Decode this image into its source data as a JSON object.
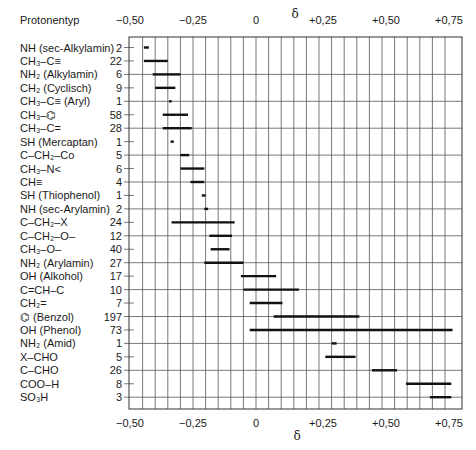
{
  "chart_data": {
    "type": "range-bar",
    "title": "",
    "column_header_left": "Protonentyp",
    "xlabel": "δ",
    "ylabel": "",
    "xlim": [
      -0.5,
      0.8
    ],
    "x_ticks": [
      -0.5,
      -0.25,
      0,
      0.25,
      0.5,
      0.75
    ],
    "x_tick_labels": [
      "−0,50",
      "−0,25",
      "0",
      "+0,25",
      "+0,50",
      "+0,75"
    ],
    "grid": {
      "vertical_step": 0.05,
      "horizontal_full_lines_every_other_row": true
    },
    "axes_top_and_bottom": true,
    "rows": [
      {
        "label": "NH (sec-Alkylamin)",
        "count": 2,
        "min": -0.445,
        "max": -0.425
      },
      {
        "label": "CH₃–C≡",
        "count": 22,
        "min": -0.445,
        "max": -0.35
      },
      {
        "label": "NH₂ (Alkylamin)",
        "count": 6,
        "min": -0.41,
        "max": -0.3
      },
      {
        "label": "CH₂ (Cyclisch)",
        "count": 9,
        "min": -0.4,
        "max": -0.32
      },
      {
        "label": "CH₃–C≡ (Aryl)",
        "count": 1,
        "min": -0.345,
        "max": -0.335
      },
      {
        "label": "CH₃–⌬",
        "count": 58,
        "min": -0.37,
        "max": -0.27
      },
      {
        "label": "CH₃–C=",
        "count": 28,
        "min": -0.37,
        "max": -0.255
      },
      {
        "label": "SH (Mercaptan)",
        "count": 1,
        "min": -0.335,
        "max": -0.33
      },
      {
        "label": "C–CH₂–Co",
        "count": 5,
        "min": -0.3,
        "max": -0.265
      },
      {
        "label": "CH₃–N<",
        "count": 6,
        "min": -0.3,
        "max": -0.205
      },
      {
        "label": "CH≡",
        "count": 4,
        "min": -0.26,
        "max": -0.205
      },
      {
        "label": "SH (Thiophenol)",
        "count": 1,
        "min": -0.215,
        "max": -0.2
      },
      {
        "label": "NH (sec-Arylamin)",
        "count": 2,
        "min": -0.205,
        "max": -0.19
      },
      {
        "label": "C–CH₂–X",
        "count": 24,
        "min": -0.335,
        "max": -0.085
      },
      {
        "label": "C–CH₂–O–",
        "count": 12,
        "min": -0.185,
        "max": -0.095
      },
      {
        "label": "CH₃–O–",
        "count": 40,
        "min": -0.18,
        "max": -0.105
      },
      {
        "label": "NH₂ (Arylamin)",
        "count": 27,
        "min": -0.205,
        "max": -0.05
      },
      {
        "label": "OH (Alkohol)",
        "count": 17,
        "min": -0.06,
        "max": 0.08
      },
      {
        "label": "C=CH–C",
        "count": 10,
        "min": -0.05,
        "max": 0.17
      },
      {
        "label": "CH₂=",
        "count": 7,
        "min": -0.025,
        "max": 0.105
      },
      {
        "label": "⌬ (Benzol)",
        "count": 197,
        "min": 0.07,
        "max": 0.41
      },
      {
        "label": "OH (Phenol)",
        "count": 73,
        "min": -0.025,
        "max": 0.78
      },
      {
        "label": "NH₂ (Amid)",
        "count": 1,
        "min": 0.3,
        "max": 0.32
      },
      {
        "label": "X–CHO",
        "count": 5,
        "min": 0.275,
        "max": 0.395
      },
      {
        "label": "C–CHO",
        "count": 26,
        "min": 0.46,
        "max": 0.56
      },
      {
        "label": "COO–H",
        "count": 8,
        "min": 0.595,
        "max": 0.775
      },
      {
        "label": "SO₃H",
        "count": 3,
        "min": 0.69,
        "max": 0.775
      }
    ]
  },
  "colors": {
    "bar": "#111111",
    "grid": "#555555",
    "text": "#1a1a1a",
    "background": "#ffffff"
  }
}
